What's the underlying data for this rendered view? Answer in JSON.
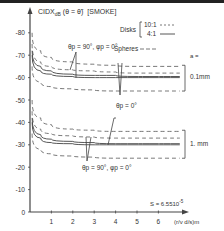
{
  "chart_data": {
    "type": "line",
    "ylabel_main": "CIDX",
    "ylabel_sub": "dB",
    "ylabel_arg": "(θ = θ̃)",
    "ylabel_tag": "[SMOKE]",
    "xlabel": "(r/v d/s)m",
    "xlim": [
      0,
      7
    ],
    "ylim": [
      0,
      -80
    ],
    "x_ticks": [
      1,
      2,
      3,
      4,
      5,
      6
    ],
    "x_tick_labels": [
      "1",
      "2",
      "3",
      "4",
      "5",
      "6"
    ],
    "y_ticks": [
      0,
      -10,
      -20,
      -30,
      -40,
      -50,
      -60,
      -70,
      -80
    ],
    "y_tick_labels": [
      "0",
      "-10",
      "-20",
      "-30",
      "-40",
      "-50",
      "-60",
      "-70",
      "-80"
    ],
    "legend": {
      "group_label": "Disks",
      "entries": [
        {
          "label": "10:1",
          "style": "dashed-short"
        },
        {
          "label": "4:1",
          "style": "solid"
        },
        {
          "label": "Spheres",
          "style": "dashed"
        }
      ],
      "placement": "top-right"
    },
    "param_label": "a =",
    "annotations": [
      {
        "text": "θp = 90°, φp = 0°",
        "group": "0.1mm"
      },
      {
        "text": "θp = 0°",
        "group": "0.1mm"
      },
      {
        "text": "θp = 90°, φp = 0°",
        "group": "1. mm"
      },
      {
        "text": "S = 6.5510",
        "superscript": "-5"
      }
    ],
    "groups": [
      {
        "name": "0.1mm",
        "series": [
          {
            "name": "Spheres upper",
            "style": "dashed",
            "x": [
              0.1,
              0.5,
              1,
              2,
              3,
              4,
              5,
              6,
              7
            ],
            "y": [
              -80,
              -72,
              -69,
              -67,
              -66,
              -65.5,
              -65,
              -65,
              -65
            ]
          },
          {
            "name": "Disks 10:1 θp=90",
            "style": "dashed-short",
            "x": [
              0.1,
              0.5,
              1,
              2,
              3,
              4,
              5,
              6,
              7
            ],
            "y": [
              -75,
              -67,
              -65,
              -63.5,
              -63,
              -62.5,
              -62,
              -62,
              -62
            ]
          },
          {
            "name": "Disks 4:1 θp=90",
            "style": "solid",
            "x": [
              0.1,
              0.5,
              1,
              2,
              3,
              4,
              5,
              6,
              7
            ],
            "y": [
              -72,
              -65,
              -63,
              -61.5,
              -61,
              -61,
              -60.5,
              -60.5,
              -60.5
            ]
          },
          {
            "name": "Disks 4:1 θp=0",
            "style": "solid",
            "x": [
              0.1,
              0.5,
              1,
              2,
              3,
              4,
              5,
              6,
              7
            ],
            "y": [
              -70,
              -63,
              -61.5,
              -60.5,
              -60,
              -60,
              -60,
              -60,
              -60
            ]
          },
          {
            "name": "Spheres lower",
            "style": "dashed",
            "x": [
              0.1,
              0.5,
              1,
              2,
              3,
              4,
              5,
              6,
              7
            ],
            "y": [
              -65,
              -58,
              -56,
              -55,
              -54.5,
              -54,
              -54,
              -54,
              -54
            ]
          }
        ]
      },
      {
        "name": "1. mm",
        "series": [
          {
            "name": "Spheres upper",
            "style": "dashed",
            "x": [
              0.1,
              0.5,
              1,
              2,
              3,
              4,
              5,
              6,
              7
            ],
            "y": [
              -50,
              -42,
              -39,
              -37,
              -36.5,
              -36,
              -36,
              -36,
              -36
            ]
          },
          {
            "name": "Disks 10:1 θp=90",
            "style": "dashed-short",
            "x": [
              0.1,
              0.5,
              1,
              2,
              3,
              4,
              5,
              6,
              7
            ],
            "y": [
              -45,
              -37,
              -35,
              -34,
              -33.5,
              -33,
              -33,
              -33,
              -33
            ]
          },
          {
            "name": "Disks 4:1 θp=90",
            "style": "solid",
            "x": [
              0.1,
              0.5,
              1,
              2,
              3,
              4,
              5,
              6,
              7
            ],
            "y": [
              -42,
              -34.5,
              -32.5,
              -31.5,
              -31,
              -30.5,
              -30.5,
              -30.5,
              -30.5
            ]
          },
          {
            "name": "Disks 4:1 θp=0",
            "style": "solid",
            "x": [
              0.1,
              0.5,
              1,
              2,
              3,
              4,
              5,
              6,
              7
            ],
            "y": [
              -40,
              -33,
              -31,
              -30.5,
              -30,
              -30,
              -30,
              -30,
              -30
            ]
          },
          {
            "name": "Spheres lower",
            "style": "dashed",
            "x": [
              0.1,
              0.5,
              1,
              2,
              3,
              4,
              5,
              6,
              7
            ],
            "y": [
              -35,
              -28,
              -26,
              -25,
              -24.5,
              -24,
              -24,
              -24,
              -24
            ]
          }
        ]
      }
    ]
  }
}
